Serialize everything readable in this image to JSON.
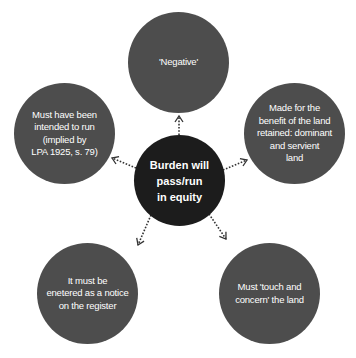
{
  "diagram": {
    "type": "hub-and-spoke",
    "center": {
      "label": "Burden will\npass/run\nin equity",
      "color": "#1c1c1c"
    },
    "outer_color": "#4d4d4d",
    "connector_style": "dotted arrow",
    "nodes": [
      {
        "id": "top",
        "label": "'Negative'"
      },
      {
        "id": "right",
        "label": "Made for the\nbenefit of the land\nretained: dominant\nand servient\nland"
      },
      {
        "id": "bottom-right",
        "label": "Must 'touch and\nconcern' the land"
      },
      {
        "id": "bottom-left",
        "label": "It must be\nenetered as a notice\non the register"
      },
      {
        "id": "left",
        "label": "Must have been\nintended to run\n(implied by\nLPA 1925, s. 79)"
      }
    ]
  }
}
